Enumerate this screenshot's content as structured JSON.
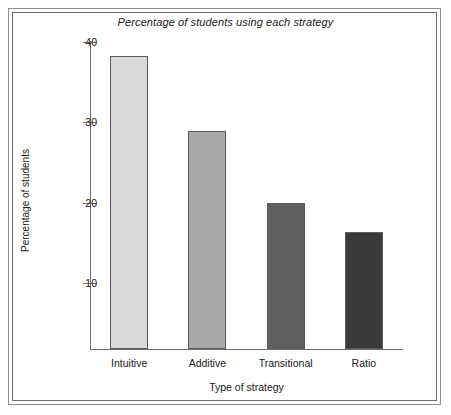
{
  "chart_data": {
    "type": "bar",
    "title": "Percentage of students using each strategy",
    "xlabel": "Type of strategy",
    "ylabel": "Percentage of students",
    "categories": [
      "Intuitive",
      "Additive",
      "Transitional",
      "Ratio"
    ],
    "values": [
      39,
      29,
      19.5,
      15.6
    ],
    "bar_colors": [
      "#d9d9d9",
      "#a8a8a8",
      "#5f5f5f",
      "#3a3a3a"
    ],
    "ylim": [
      0,
      41
    ],
    "yticks": [
      10,
      20,
      30,
      40
    ],
    "ytick_labels": [
      "10",
      "20",
      "30",
      "40"
    ],
    "grid": false,
    "legend": null,
    "legend_position": "none",
    "axis_color": "#6f6f6f",
    "frame_color": "#8e8e8e",
    "background": "#ffffff"
  }
}
